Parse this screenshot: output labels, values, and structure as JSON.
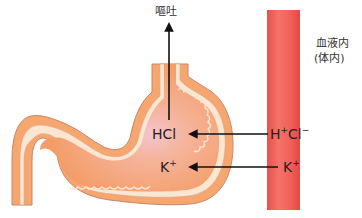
{
  "diagram": {
    "labels": {
      "vomit": "嘔吐",
      "blood_line1": "血液内",
      "blood_line2": "(体内)",
      "stomach_hcl": "HCl",
      "stomach_k": "K",
      "stomach_k_charge": "+",
      "blood_h": "H",
      "blood_h_charge": "+",
      "blood_cl": "Cl",
      "blood_cl_charge": "−",
      "blood_k": "K",
      "blood_k_charge": "+"
    },
    "arrows": [
      {
        "from": "stomach",
        "to": "vomit",
        "direction": "up"
      },
      {
        "from": "blood H+Cl−",
        "to": "stomach HCl",
        "direction": "left"
      },
      {
        "from": "blood K+",
        "to": "stomach K+",
        "direction": "left"
      }
    ],
    "colors": {
      "stomach_fill": "#f5a06e",
      "stomach_center": "#f3c3c8",
      "stomach_lining": "#fbe8d6",
      "stomach_outline": "#c8866a",
      "vessel_light": "#f2635a",
      "vessel_dark": "#e24b45",
      "arrow": "#111111"
    }
  }
}
